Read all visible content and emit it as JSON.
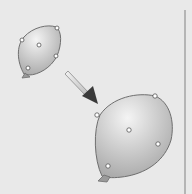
{
  "figure": {
    "colors": {
      "background": "#e9e9e9",
      "balloon_light": "#f4f4f4",
      "balloon_dark": "#a9a9a9",
      "balloon_outline": "#6f6f6f",
      "handle_fill": "#ffffff",
      "handle_stroke": "#555555",
      "arrow_shaft": "#d8d8d8",
      "arrow_head": "#3a3a3a",
      "border": "#b5b5b5"
    },
    "shapes": [
      {
        "name": "small-balloon",
        "control_point_count": 5
      },
      {
        "name": "large-balloon",
        "control_point_count": 5
      }
    ],
    "arrow": {
      "direction": "down-right",
      "meaning": "scale-up"
    }
  }
}
